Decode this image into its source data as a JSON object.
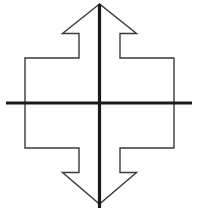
{
  "figure": {
    "kind": "line-diagram",
    "canvas": {
      "width": 198,
      "height": 212,
      "background": "#ffffff"
    },
    "colors": {
      "outline": "#3a3a3a",
      "axis": "#1a1a1a",
      "background": "#ffffff"
    },
    "strokes": {
      "outline_width": 1.4,
      "vertical_axis_width": 3.2,
      "horizontal_axis_width": 3.2
    },
    "geometry": {
      "center": {
        "x": 99.5,
        "y": 103
      },
      "vertical_axis": {
        "x": 99.5,
        "y1": 4,
        "y2": 208
      },
      "horizontal_axis": {
        "y": 103,
        "x1": 6,
        "x2": 192
      },
      "outline_points": "99.5,4 62.5,33.5 79,33.5 79,58 25,58 25,148 79,148 79,172.5 62.5,172.5 99.5,204 136.5,172.5 120,172.5 120,148 174,148 174,58 120,58 120,33.5 136.5,33.5",
      "arrow_top_apex": {
        "x": 99.5,
        "y": 4
      },
      "arrow_bottom_apex": {
        "x": 99.5,
        "y": 204
      },
      "arrow_head_half_width": 37,
      "notch_inner_half_width": 20.5,
      "body_half_width": 74.5,
      "notch_top_y": 33.5,
      "shoulder_top_y": 58,
      "shoulder_bottom_y": 148,
      "notch_bottom_y": 172.5
    },
    "labels": {
      "top_arrowhead": "top-arrowhead",
      "bottom_arrowhead": "bottom-arrowhead",
      "left_arm": "left-arm",
      "right_arm": "right-arm",
      "vertical_axis": "vertical-axis",
      "horizontal_axis": "horizontal-axis"
    }
  }
}
